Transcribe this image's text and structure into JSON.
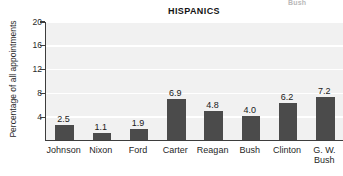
{
  "bleed_text": "Bush",
  "chart_data": {
    "type": "bar",
    "title": "HISPANICS",
    "xlabel": "",
    "ylabel": "Percentage of all appointments",
    "ylim": [
      0,
      20
    ],
    "yticks": [
      4,
      8,
      12,
      16,
      20
    ],
    "grid": true,
    "legend": "none",
    "bar_color": "#4b4b4b",
    "plot_background": "#f1f1f1",
    "categories": [
      "Johnson",
      "Nixon",
      "Ford",
      "Carter",
      "Reagan",
      "Bush",
      "Clinton",
      "G. W. Bush"
    ],
    "values": [
      2.5,
      1.1,
      1.9,
      6.9,
      4.8,
      4.0,
      6.2,
      7.2
    ],
    "value_labels": [
      "2.5",
      "1.1",
      "1.9",
      "6.9",
      "4.8",
      "4.0",
      "6.2",
      "7.2"
    ],
    "ytick_labels": [
      "4",
      "8",
      "12",
      "16",
      "20"
    ]
  }
}
